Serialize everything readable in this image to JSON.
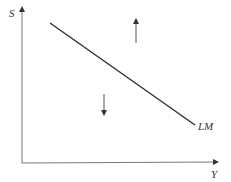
{
  "diagram": {
    "y_axis_label": "S",
    "x_axis_label": "Y",
    "curve_label": "LM",
    "arrows": [
      {
        "name": "upward-arrow",
        "direction": "up",
        "region": "above LM"
      },
      {
        "name": "downward-arrow",
        "direction": "down",
        "region": "below LM"
      }
    ],
    "colors": {
      "line": "#333333",
      "axis": "#666666"
    }
  }
}
